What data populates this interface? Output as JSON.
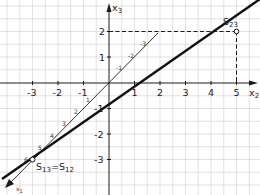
{
  "diagram": {
    "type": "coordinate-system-3d-trace-lines",
    "axes": {
      "x2": {
        "label": "x",
        "sub": "2",
        "ticks": [
          "-3",
          "-2",
          "-1",
          "1",
          "2",
          "3",
          "4",
          "5"
        ]
      },
      "x3": {
        "label": "x",
        "sub": "3",
        "ticks": [
          "2",
          "1",
          "-1",
          "-2",
          "-3"
        ]
      },
      "x1": {
        "label": "x",
        "sub": "1",
        "ticks_pos": [
          "1",
          "2",
          "3",
          "4",
          "5",
          "6"
        ],
        "ticks_neg": [
          "-1",
          "-2",
          "-3"
        ]
      }
    },
    "points": {
      "s23": {
        "name": "S",
        "sub": "23",
        "x2": 5,
        "x3": 2
      },
      "s13": {
        "name": "S",
        "sub1": "13",
        "eq": "=",
        "name2": "S",
        "sub2": "12",
        "x2": -3,
        "x3": -3
      }
    },
    "colors": {
      "grid": "#c8c8c8",
      "axis": "#1a1a1a",
      "line": "#111111"
    }
  }
}
